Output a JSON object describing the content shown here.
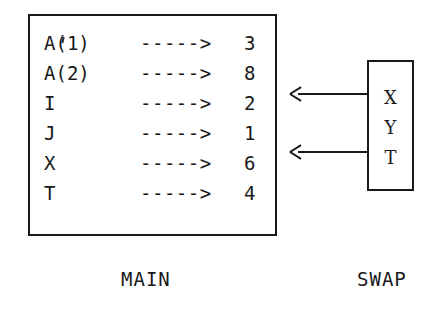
{
  "figure": {
    "background": "#ffffff",
    "ink_color": "#1a1a1a"
  },
  "main_box": {
    "caption": "MAIN",
    "rows": [
      {
        "name": "A(1)",
        "arrow": "----->",
        "value": "3"
      },
      {
        "name": "A(2)",
        "arrow": "----->",
        "value": "8"
      },
      {
        "name": "I",
        "arrow": "----->",
        "value": "2"
      },
      {
        "name": "J",
        "arrow": "----->",
        "value": "1"
      },
      {
        "name": "X",
        "arrow": "----->",
        "value": "6"
      },
      {
        "name": "T",
        "arrow": "----->",
        "value": "4"
      }
    ]
  },
  "swap_box": {
    "caption": "SWAP",
    "vars": [
      {
        "name": "X"
      },
      {
        "name": "Y"
      },
      {
        "name": "T"
      }
    ]
  },
  "links": [
    {
      "from": "X",
      "to": "I",
      "glyph": "<-----"
    },
    {
      "from": "T",
      "to": "X",
      "glyph": "<-----"
    }
  ]
}
